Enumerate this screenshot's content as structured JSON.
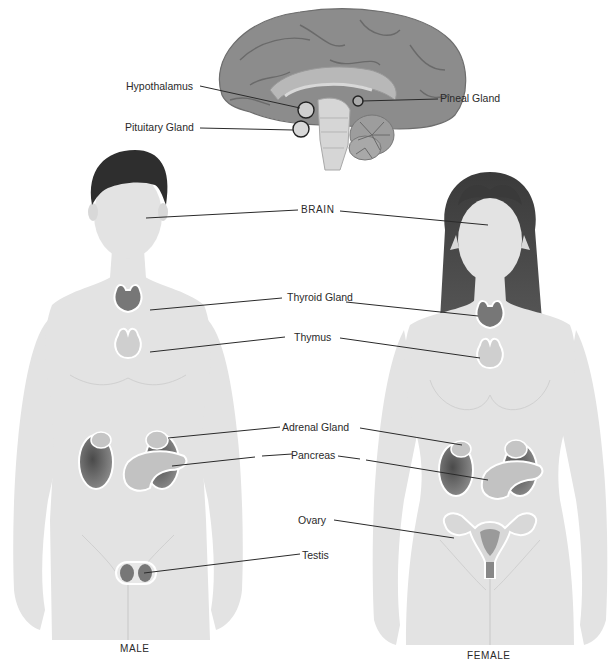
{
  "diagram": {
    "brain_labels": {
      "hypothalamus": "Hypothalamus",
      "pituitary": "Pituitary Gland",
      "pineal": "Pineal Gland"
    },
    "body_labels": {
      "brain": "BRAIN",
      "thyroid": "Thyroid Gland",
      "thymus": "Thymus",
      "adrenal": "Adrenal Gland",
      "pancreas": "Pancreas",
      "ovary": "Ovary",
      "testis": "Testis"
    },
    "figures": {
      "male": "MALE",
      "female": "FEMALE"
    },
    "colors": {
      "background": "#ffffff",
      "skin": "#e3e3e3",
      "skin_line": "#cfcfcf",
      "hair": "#2e2e2e",
      "brain": "#8f8f8f",
      "organ_dark": "#6a6a6a",
      "organ_light": "#c4c4c4",
      "leader_line": "#2a2a2a",
      "text": "#2a2a2a"
    }
  }
}
